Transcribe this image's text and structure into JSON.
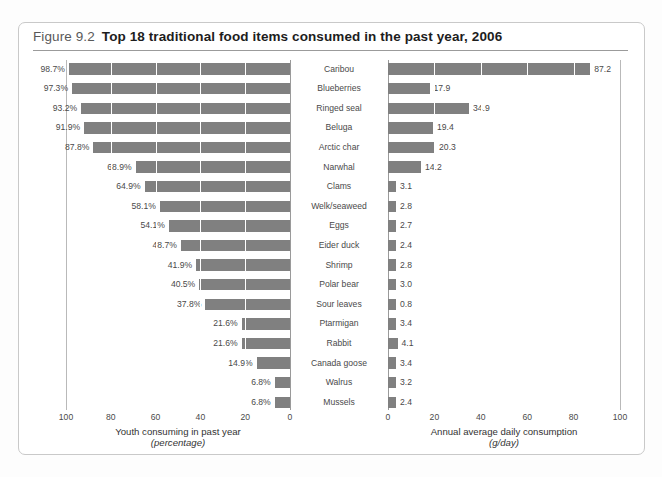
{
  "figure": {
    "number": "Figure 9.2",
    "title": "Top 18 traditional food items consumed in the past year, 2006"
  },
  "left_axis": {
    "caption_line1": "Youth consuming in past year",
    "caption_line2": "(percentage)",
    "ticks": [
      "100",
      "80",
      "60",
      "40",
      "20",
      "0"
    ]
  },
  "right_axis": {
    "caption_line1": "Annual average daily consumption",
    "caption_line2": "(g/day)",
    "ticks": [
      "0",
      "20",
      "40",
      "60",
      "80",
      "100"
    ]
  },
  "colors": {
    "bar": "#808080",
    "frame": "#c9c9c9",
    "rule": "#9b9b9b",
    "text": "#4a4a4a"
  },
  "chart_data": {
    "type": "bar",
    "title": "Top 18 traditional food items consumed in the past year, 2006",
    "orientation": "horizontal",
    "categories": [
      "Caribou",
      "Blueberries",
      "Ringed seal",
      "Beluga",
      "Arctic char",
      "Narwhal",
      "Clams",
      "Welk/seaweed",
      "Eggs",
      "Eider duck",
      "Shrimp",
      "Polar bear",
      "Sour leaves",
      "Ptarmigan",
      "Rabbit",
      "Canada goose",
      "Walrus",
      "Mussels"
    ],
    "series": [
      {
        "name": "Youth consuming in past year (percentage)",
        "axis": "left",
        "direction": "right-to-left",
        "xlabel": "Youth consuming in past year (percentage)",
        "xlim": [
          0,
          100
        ],
        "values": [
          98.7,
          97.3,
          93.2,
          91.9,
          87.8,
          68.9,
          64.9,
          58.1,
          54.1,
          48.7,
          41.9,
          40.5,
          37.8,
          21.6,
          21.6,
          14.9,
          6.8,
          6.8
        ],
        "labels": [
          "98.7%",
          "97.3%",
          "93.2%",
          "91.9%",
          "87.8%",
          "68.9%",
          "64.9%",
          "58.1%",
          "54.1%",
          "48.7%",
          "41.9%",
          "40.5%",
          "37.8%",
          "21.6%",
          "21.6%",
          "14.9%",
          "6.8%",
          "6.8%"
        ]
      },
      {
        "name": "Annual average daily consumption (g/day)",
        "axis": "right",
        "direction": "left-to-right",
        "xlabel": "Annual average daily consumption (g/day)",
        "xlim": [
          0,
          100
        ],
        "values": [
          87.2,
          17.9,
          34.9,
          19.4,
          20.3,
          14.2,
          3.1,
          2.8,
          2.7,
          2.4,
          2.8,
          3.0,
          0.8,
          3.4,
          4.1,
          3.4,
          3.2,
          2.4
        ],
        "labels": [
          "87.2",
          "17.9",
          "34.9",
          "19.4",
          "20.3",
          "14.2",
          "3.1",
          "2.8",
          "2.7",
          "2.4",
          "2.8",
          "3.0",
          "0.8",
          "3.4",
          "4.1",
          "3.4",
          "3.2",
          "2.4"
        ]
      }
    ],
    "grid": true,
    "legend": "none"
  }
}
